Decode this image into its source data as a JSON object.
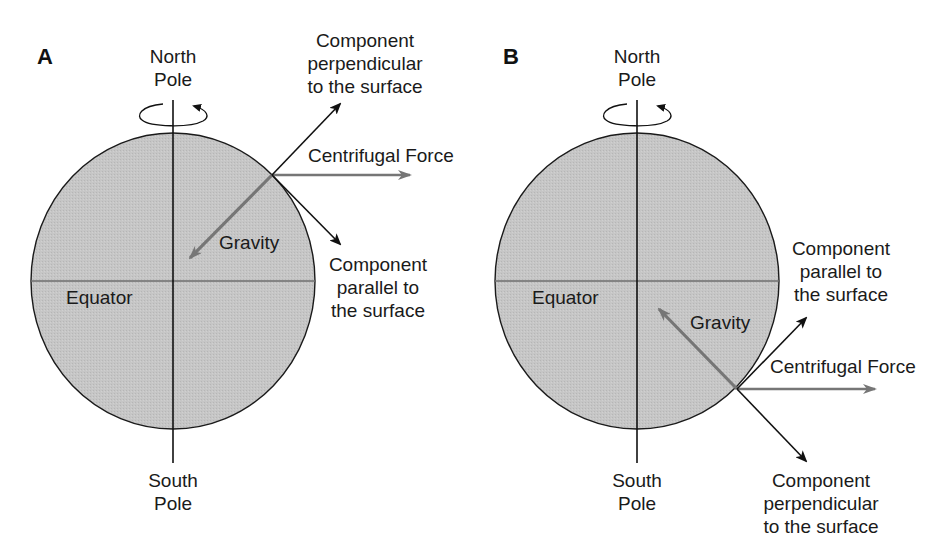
{
  "colors": {
    "earth_fill": "#c4c4c4",
    "earth_stroke": "#1a1a1a",
    "axis": "#111111",
    "equator": "#6e6e6e",
    "gravity_arrow": "#767676",
    "centrifugal_arrow": "#767676",
    "component_arrow": "#111111",
    "text": "#1a1a1a"
  },
  "panels": [
    {
      "id": "A",
      "letter": "A",
      "labels": {
        "north_pole": "North\nPole",
        "south_pole": "South\nPole",
        "equator": "Equator",
        "gravity": "Gravity",
        "centrifugal": "Centrifugal Force",
        "perpendicular": "Component\nperpendicular\nto the surface",
        "parallel": "Component\nparallel to\nthe surface"
      },
      "hemisphere": "northern"
    },
    {
      "id": "B",
      "letter": "B",
      "labels": {
        "north_pole": "North\nPole",
        "south_pole": "South\nPole",
        "equator": "Equator",
        "gravity": "Gravity",
        "centrifugal": "Centrifugal Force",
        "parallel": "Component\nparallel to\nthe surface",
        "perpendicular": "Component\nperpendicular\nto the surface"
      },
      "hemisphere": "southern"
    }
  ]
}
